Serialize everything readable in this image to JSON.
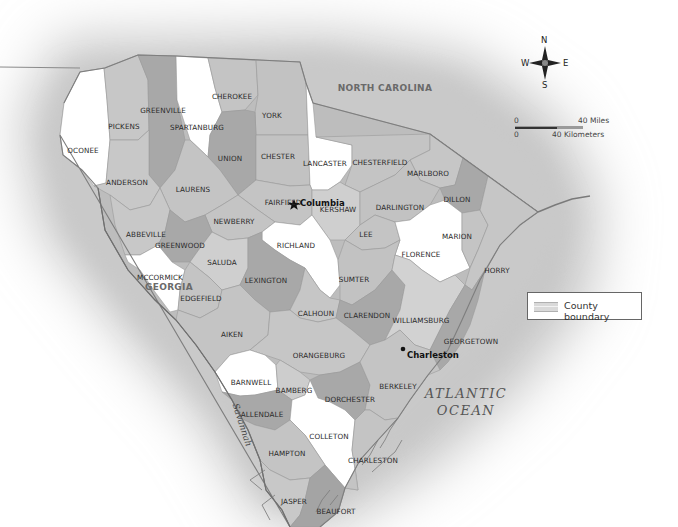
{
  "map": {
    "title": "South Carolina counties",
    "colors": {
      "background": "#ffffff",
      "halo": "#c8c8c8",
      "county_white": "#ffffff",
      "county_light": "#c9c9c9",
      "county_mid": "#b4b4b4",
      "county_dark": "#9c9c9c",
      "border": "#7a7a7a",
      "water": "#8a8a8a"
    },
    "neighbors": {
      "north": "NORTH CAROLINA",
      "west": "GEORGIA"
    },
    "ocean": {
      "line1": "ATLANTIC",
      "line2": "OCEAN"
    },
    "river": "Savannah",
    "cities": {
      "capital": "Columbia",
      "other": "Charleston"
    },
    "counties": [
      {
        "name": "OCONEE",
        "x": 83,
        "y": 150,
        "shade": "white"
      },
      {
        "name": "PICKENS",
        "x": 124,
        "y": 126,
        "shade": "light"
      },
      {
        "name": "GREENVILLE",
        "x": 163,
        "y": 110,
        "shade": "dark"
      },
      {
        "name": "SPARTANBURG",
        "x": 197,
        "y": 127,
        "shade": "white"
      },
      {
        "name": "CHEROKEE",
        "x": 232,
        "y": 96,
        "shade": "light"
      },
      {
        "name": "YORK",
        "x": 272,
        "y": 115,
        "shade": "light"
      },
      {
        "name": "UNION",
        "x": 230,
        "y": 158,
        "shade": "dark"
      },
      {
        "name": "CHESTER",
        "x": 278,
        "y": 156,
        "shade": "light"
      },
      {
        "name": "LANCASTER",
        "x": 325,
        "y": 163,
        "shade": "white"
      },
      {
        "name": "CHESTERFIELD",
        "x": 380,
        "y": 162,
        "shade": "light"
      },
      {
        "name": "MARLBORO",
        "x": 428,
        "y": 173,
        "shade": "light"
      },
      {
        "name": "ANDERSON",
        "x": 127,
        "y": 182,
        "shade": "light"
      },
      {
        "name": "LAURENS",
        "x": 193,
        "y": 189,
        "shade": "light"
      },
      {
        "name": "FAIRFIELD",
        "x": 283,
        "y": 202,
        "shade": "light"
      },
      {
        "name": "KERSHAW",
        "x": 338,
        "y": 209,
        "shade": "light"
      },
      {
        "name": "DARLINGTON",
        "x": 400,
        "y": 207,
        "shade": "light"
      },
      {
        "name": "DILLON",
        "x": 457,
        "y": 199,
        "shade": "dark"
      },
      {
        "name": "NEWBERRY",
        "x": 234,
        "y": 221,
        "shade": "light"
      },
      {
        "name": "ABBEVILLE",
        "x": 146,
        "y": 234,
        "shade": "light"
      },
      {
        "name": "GREENWOOD",
        "x": 180,
        "y": 245,
        "shade": "dark"
      },
      {
        "name": "RICHLAND",
        "x": 296,
        "y": 245,
        "shade": "white"
      },
      {
        "name": "LEE",
        "x": 366,
        "y": 234,
        "shade": "light"
      },
      {
        "name": "MARION",
        "x": 457,
        "y": 236,
        "shade": "light"
      },
      {
        "name": "FLORENCE",
        "x": 421,
        "y": 254,
        "shade": "white"
      },
      {
        "name": "SALUDA",
        "x": 222,
        "y": 262,
        "shade": "light"
      },
      {
        "name": "HORRY",
        "x": 497,
        "y": 270,
        "shade": "light"
      },
      {
        "name": "MCCORMICK",
        "x": 160,
        "y": 277,
        "shade": "white"
      },
      {
        "name": "LEXINGTON",
        "x": 266,
        "y": 280,
        "shade": "dark"
      },
      {
        "name": "SUMTER",
        "x": 354,
        "y": 279,
        "shade": "light"
      },
      {
        "name": "EDGEFIELD",
        "x": 201,
        "y": 298,
        "shade": "light"
      },
      {
        "name": "CALHOUN",
        "x": 316,
        "y": 313,
        "shade": "light"
      },
      {
        "name": "CLARENDON",
        "x": 367,
        "y": 315,
        "shade": "dark"
      },
      {
        "name": "WILLIAMSBURG",
        "x": 421,
        "y": 320,
        "shade": "light"
      },
      {
        "name": "AIKEN",
        "x": 232,
        "y": 334,
        "shade": "light"
      },
      {
        "name": "GEORGETOWN",
        "x": 471,
        "y": 341,
        "shade": "dark"
      },
      {
        "name": "ORANGEBURG",
        "x": 319,
        "y": 355,
        "shade": "light"
      },
      {
        "name": "BARNWELL",
        "x": 251,
        "y": 382,
        "shade": "white"
      },
      {
        "name": "BAMBERG",
        "x": 294,
        "y": 390,
        "shade": "light"
      },
      {
        "name": "BERKELEY",
        "x": 398,
        "y": 386,
        "shade": "light"
      },
      {
        "name": "DORCHESTER",
        "x": 350,
        "y": 399,
        "shade": "dark"
      },
      {
        "name": "ALLENDALE",
        "x": 262,
        "y": 414,
        "shade": "dark"
      },
      {
        "name": "COLLETON",
        "x": 329,
        "y": 436,
        "shade": "white"
      },
      {
        "name": "HAMPTON",
        "x": 287,
        "y": 453,
        "shade": "light"
      },
      {
        "name": "CHARLESTON",
        "x": 373,
        "y": 460,
        "shade": "light"
      },
      {
        "name": "JASPER",
        "x": 294,
        "y": 501,
        "shade": "light"
      },
      {
        "name": "BEAUFORT",
        "x": 336,
        "y": 511,
        "shade": "dark"
      }
    ],
    "compass": {
      "n": "N",
      "s": "S",
      "e": "E",
      "w": "W"
    },
    "scale_bar": {
      "miles_start": "0",
      "miles_end": "40 Miles",
      "km_start": "0",
      "km_end": "40 Kilometers"
    },
    "legend": {
      "items": [
        {
          "label": "County boundary"
        }
      ]
    }
  }
}
